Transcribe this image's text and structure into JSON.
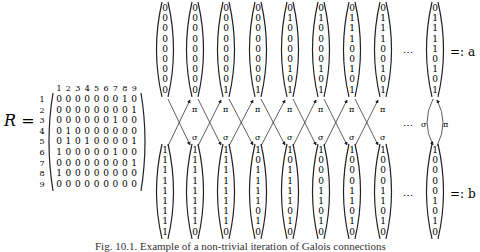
{
  "figure": {
    "matrix_label": "R =",
    "column_indices": [
      "1",
      "2",
      "3",
      "4",
      "5",
      "6",
      "7",
      "8",
      "9"
    ],
    "row_indices": [
      "1",
      "2",
      "3",
      "4",
      "5",
      "6",
      "7",
      "8",
      "9"
    ],
    "matrix_rows": [
      [
        0,
        0,
        0,
        0,
        0,
        0,
        0,
        1,
        0
      ],
      [
        0,
        0,
        0,
        0,
        0,
        0,
        0,
        0,
        1
      ],
      [
        0,
        0,
        0,
        0,
        0,
        0,
        1,
        0,
        0
      ],
      [
        0,
        1,
        0,
        0,
        0,
        0,
        0,
        0,
        0
      ],
      [
        0,
        1,
        0,
        1,
        0,
        0,
        0,
        0,
        1
      ],
      [
        1,
        0,
        0,
        0,
        0,
        0,
        1,
        0,
        0
      ],
      [
        0,
        0,
        0,
        0,
        0,
        0,
        0,
        0,
        1
      ],
      [
        1,
        0,
        0,
        0,
        0,
        0,
        0,
        0,
        0
      ],
      [
        0,
        0,
        0,
        0,
        0,
        0,
        0,
        0,
        0
      ]
    ],
    "top_vectors": [
      [
        0,
        0,
        0,
        0,
        0,
        0,
        0,
        0,
        0
      ],
      [
        0,
        0,
        0,
        0,
        0,
        0,
        0,
        0,
        0
      ],
      [
        0,
        0,
        0,
        0,
        0,
        0,
        0,
        0,
        1
      ],
      [
        0,
        0,
        0,
        0,
        0,
        0,
        0,
        0,
        1
      ],
      [
        0,
        1,
        0,
        0,
        0,
        0,
        1,
        0,
        1
      ],
      [
        0,
        1,
        0,
        0,
        0,
        0,
        1,
        0,
        1
      ],
      [
        0,
        1,
        1,
        1,
        0,
        0,
        1,
        0,
        1
      ],
      [
        0,
        1,
        1,
        1,
        0,
        0,
        1,
        0,
        1
      ]
    ],
    "top_limit_vector": [
      0,
      1,
      1,
      1,
      1,
      0,
      1,
      0,
      1
    ],
    "top_limit_label": "=: a",
    "bottom_vectors": [
      [
        1,
        1,
        1,
        1,
        1,
        1,
        1,
        1,
        1
      ],
      [
        1,
        1,
        1,
        1,
        1,
        1,
        1,
        1,
        0
      ],
      [
        1,
        1,
        1,
        1,
        1,
        1,
        1,
        1,
        0
      ],
      [
        1,
        0,
        1,
        1,
        1,
        1,
        0,
        1,
        0
      ],
      [
        1,
        0,
        1,
        1,
        1,
        1,
        0,
        1,
        0
      ],
      [
        1,
        0,
        0,
        0,
        1,
        1,
        0,
        1,
        0
      ],
      [
        1,
        0,
        0,
        0,
        1,
        1,
        0,
        1,
        0
      ],
      [
        1,
        0,
        0,
        0,
        1,
        1,
        0,
        1,
        0
      ]
    ],
    "bottom_limit_vector": [
      1,
      0,
      0,
      0,
      0,
      1,
      0,
      1,
      0
    ],
    "bottom_limit_label": "=: b",
    "ellipsis": "…",
    "arrow_up_label": "π",
    "arrow_down_label": "σ",
    "caption": "Fig. 10.1. Example of a non-trivial iteration of Galois connections"
  }
}
